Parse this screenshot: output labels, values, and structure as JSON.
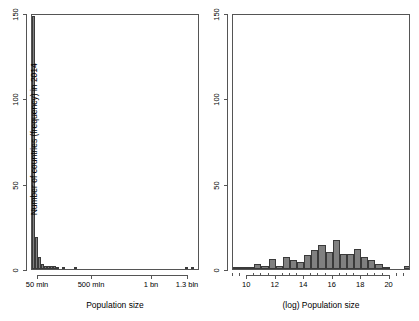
{
  "figure": {
    "background": "#ffffff",
    "bar_fill": "#808080",
    "bar_stroke": "#3a3a3a",
    "axis_color": "#555555",
    "panels": 2
  },
  "chart_data": [
    {
      "type": "bar",
      "panel": "left",
      "title": "",
      "xlabel": "Population size",
      "ylabel": "Number of countries (frequency) in 2014",
      "xlim": [
        0,
        1400000000
      ],
      "ylim": [
        0,
        150
      ],
      "grid": false,
      "legend": null,
      "ytick_values": [
        0,
        50,
        100,
        150
      ],
      "ytick_labels": [
        "0",
        "50",
        "100",
        "150"
      ],
      "xtick_values": [
        50000000,
        500000000,
        1000000000,
        1300000000
      ],
      "xtick_labels": [
        "50 mln",
        "500 mln",
        "1 bn",
        "1.3 bln"
      ],
      "bin_width": 25000000,
      "bin_starts": [
        0,
        25000000,
        50000000,
        75000000,
        100000000,
        125000000,
        150000000,
        175000000,
        200000000,
        225000000,
        250000000,
        275000000,
        300000000,
        325000000,
        350000000,
        375000000,
        1275000000,
        1325000000
      ],
      "values": [
        148,
        19,
        7,
        3,
        2,
        2,
        2,
        2,
        1,
        0,
        1,
        0,
        0,
        0,
        1,
        0,
        1,
        1
      ]
    },
    {
      "type": "bar",
      "panel": "right",
      "title": "",
      "xlabel": "(log) Population size",
      "ylabel": "",
      "xlim": [
        9,
        21.5
      ],
      "ylim": [
        0,
        150
      ],
      "grid": false,
      "legend": null,
      "ytick_values": [
        0,
        50,
        100,
        150
      ],
      "ytick_labels": [
        "0",
        "50",
        "100",
        "150"
      ],
      "xtick_values": [
        10,
        12,
        14,
        16,
        18,
        20
      ],
      "xtick_labels": [
        "10",
        "12",
        "14",
        "16",
        "18",
        "20"
      ],
      "xtick_minor_values": [
        9,
        9.5,
        10.5,
        11,
        11.5,
        12.5,
        13,
        13.5,
        14.5,
        15,
        15.5,
        16.5,
        17,
        17.5,
        18.5,
        19,
        19.5,
        20.5,
        21
      ],
      "bin_width": 0.5,
      "bin_starts": [
        9.0,
        9.5,
        10.0,
        10.5,
        11.0,
        11.5,
        12.0,
        12.5,
        13.0,
        13.5,
        14.0,
        14.5,
        15.0,
        15.5,
        16.0,
        16.5,
        17.0,
        17.5,
        18.0,
        18.5,
        19.0,
        19.5,
        20.0,
        20.5,
        21.0
      ],
      "values": [
        1,
        1,
        1,
        3,
        2,
        6,
        2,
        7,
        5,
        4,
        8,
        11,
        14,
        10,
        17,
        9,
        9,
        12,
        7,
        5,
        3,
        1,
        0,
        0,
        2
      ]
    }
  ],
  "left_panel": {
    "y_axis_title": "Number of countries (frequency) in 2014",
    "x_axis_title": "Population size",
    "y_ticks": [
      "0",
      "50",
      "100",
      "150"
    ],
    "x_ticks": [
      "50 mln",
      "500 mln",
      "1 bn",
      "1.3 bln"
    ]
  },
  "right_panel": {
    "y_axis_title": "",
    "x_axis_title": "(log) Population size",
    "y_ticks": [
      "0",
      "50",
      "100",
      "150"
    ],
    "x_ticks": [
      "10",
      "12",
      "14",
      "16",
      "18",
      "20"
    ]
  }
}
